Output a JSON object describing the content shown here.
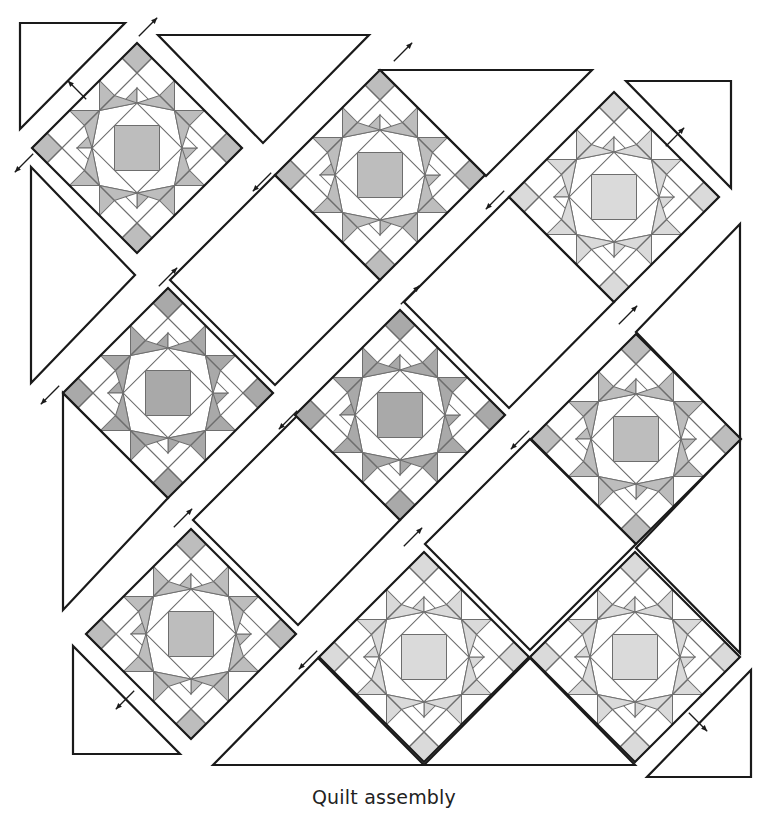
{
  "caption": "Quilt assembly",
  "colors": {
    "outline": "#1a1a1a",
    "seam": "#6e6e6e",
    "background": "#ffffff",
    "fabric_white": "#ffffff",
    "shade_dark": "#a9a9a9",
    "shade_medium": "#bdbdbd",
    "shade_light": "#dadada"
  },
  "block": {
    "half_diagonal": 105,
    "pattern": "ohio-star-variation"
  },
  "blocks": [
    {
      "id": "block-1",
      "cx": 137,
      "cy": 148,
      "shade": "shade_medium"
    },
    {
      "id": "block-2",
      "cx": 380,
      "cy": 175,
      "shade": "shade_medium"
    },
    {
      "id": "block-3",
      "cx": 614,
      "cy": 197,
      "shade": "shade_light"
    },
    {
      "id": "block-4",
      "cx": 168,
      "cy": 393,
      "shade": "shade_dark"
    },
    {
      "id": "block-5",
      "cx": 400,
      "cy": 415,
      "shade": "shade_dark"
    },
    {
      "id": "block-6",
      "cx": 636,
      "cy": 439,
      "shade": "shade_medium"
    },
    {
      "id": "block-7",
      "cx": 191,
      "cy": 634,
      "shade": "shade_medium"
    },
    {
      "id": "block-8",
      "cx": 424,
      "cy": 657,
      "shade": "shade_light"
    },
    {
      "id": "block-9",
      "cx": 635,
      "cy": 657,
      "shade": "shade_light"
    }
  ],
  "setting_squares": [
    {
      "id": "setting-square-1",
      "points": [
        [
          275,
          175
        ],
        [
          380,
          280
        ],
        [
          275,
          385
        ],
        [
          170,
          280
        ]
      ]
    },
    {
      "id": "setting-square-2",
      "points": [
        [
          509,
          197
        ],
        [
          614,
          302
        ],
        [
          509,
          408
        ],
        [
          404,
          302
        ]
      ]
    },
    {
      "id": "setting-square-3",
      "points": [
        [
          298,
          415
        ],
        [
          400,
          520
        ],
        [
          298,
          625
        ],
        [
          193,
          520
        ]
      ]
    },
    {
      "id": "setting-square-4",
      "points": [
        [
          530,
          439
        ],
        [
          636,
          544
        ],
        [
          530,
          650
        ],
        [
          425,
          544
        ]
      ]
    }
  ],
  "side_triangles": [
    {
      "id": "side-triangle-top-1",
      "points": [
        [
          158,
          35
        ],
        [
          369,
          35
        ],
        [
          263,
          143
        ]
      ]
    },
    {
      "id": "side-triangle-top-2",
      "points": [
        [
          380,
          70
        ],
        [
          592,
          70
        ],
        [
          486,
          176
        ]
      ]
    },
    {
      "id": "side-triangle-left-1",
      "points": [
        [
          31,
          167
        ],
        [
          135,
          275
        ],
        [
          31,
          383
        ]
      ]
    },
    {
      "id": "side-triangle-left-2",
      "points": [
        [
          63,
          393
        ],
        [
          168,
          498
        ],
        [
          63,
          610
        ]
      ]
    },
    {
      "id": "side-triangle-right-1",
      "points": [
        [
          740,
          224
        ],
        [
          740,
          439
        ],
        [
          636,
          332
        ]
      ]
    },
    {
      "id": "side-triangle-right-2",
      "points": [
        [
          740,
          439
        ],
        [
          740,
          653
        ],
        [
          636,
          548
        ]
      ]
    },
    {
      "id": "side-triangle-bottom-1",
      "points": [
        [
          213,
          765
        ],
        [
          424,
          765
        ],
        [
          318,
          658
        ]
      ]
    },
    {
      "id": "side-triangle-bottom-2",
      "points": [
        [
          424,
          765
        ],
        [
          635,
          765
        ],
        [
          530,
          658
        ]
      ]
    }
  ],
  "corner_triangles": [
    {
      "id": "corner-triangle-top-left",
      "points": [
        [
          20,
          23
        ],
        [
          125,
          23
        ],
        [
          20,
          129
        ]
      ]
    },
    {
      "id": "corner-triangle-top-right",
      "points": [
        [
          626,
          81
        ],
        [
          731,
          81
        ],
        [
          731,
          188
        ]
      ]
    },
    {
      "id": "corner-triangle-bottom-left",
      "points": [
        [
          73,
          646
        ],
        [
          73,
          754
        ],
        [
          180,
          754
        ]
      ]
    },
    {
      "id": "corner-triangle-bottom-right",
      "points": [
        [
          751,
          670
        ],
        [
          751,
          777
        ],
        [
          647,
          777
        ]
      ]
    }
  ],
  "arrows": [
    {
      "id": "arrow-1",
      "x": 148,
      "y": 27,
      "dir": "ne"
    },
    {
      "id": "arrow-2",
      "x": 77,
      "y": 90,
      "dir": "nw"
    },
    {
      "id": "arrow-3",
      "x": 24,
      "y": 163,
      "dir": "sw"
    },
    {
      "id": "arrow-4",
      "x": 262,
      "y": 182,
      "dir": "sw"
    },
    {
      "id": "arrow-5",
      "x": 168,
      "y": 277,
      "dir": "ne"
    },
    {
      "id": "arrow-6",
      "x": 403,
      "y": 52,
      "dir": "ne"
    },
    {
      "id": "arrow-7",
      "x": 495,
      "y": 200,
      "dir": "sw"
    },
    {
      "id": "arrow-8",
      "x": 50,
      "y": 395,
      "dir": "sw"
    },
    {
      "id": "arrow-9",
      "x": 410,
      "y": 295,
      "dir": "ne"
    },
    {
      "id": "arrow-10",
      "x": 288,
      "y": 420,
      "dir": "sw"
    },
    {
      "id": "arrow-11",
      "x": 675,
      "y": 137,
      "dir": "ne"
    },
    {
      "id": "arrow-12",
      "x": 183,
      "y": 518,
      "dir": "ne"
    },
    {
      "id": "arrow-13",
      "x": 520,
      "y": 440,
      "dir": "sw"
    },
    {
      "id": "arrow-14",
      "x": 628,
      "y": 315,
      "dir": "ne"
    },
    {
      "id": "arrow-15",
      "x": 413,
      "y": 537,
      "dir": "ne"
    },
    {
      "id": "arrow-16",
      "x": 308,
      "y": 660,
      "dir": "sw"
    },
    {
      "id": "arrow-17",
      "x": 125,
      "y": 700,
      "dir": "sw"
    },
    {
      "id": "arrow-18",
      "x": 698,
      "y": 722,
      "dir": "se"
    }
  ]
}
